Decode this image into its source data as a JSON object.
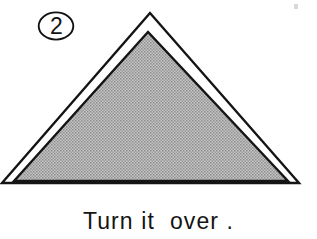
{
  "figure": {
    "step_number": "2",
    "caption": "Turn it  over .",
    "colors": {
      "ink": "#141414",
      "paper_front": "#b2b2b2",
      "paper_back": "#ffffff",
      "background": "#ffffff"
    },
    "shape": {
      "name": "triangle",
      "outer_triangle_points": "150,13 2,183 299,183",
      "inner_triangle_points": "148,32 14,181 288,181",
      "outline_width_px": 2.4
    },
    "icons": {
      "badge": "circled-number-icon",
      "speck": "scan-speck-artifact"
    }
  }
}
